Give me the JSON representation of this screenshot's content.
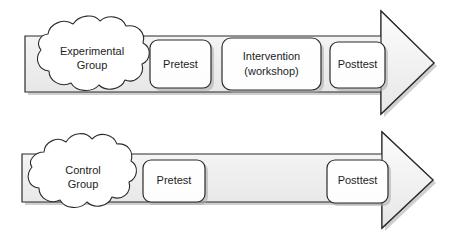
{
  "diagram": {
    "type": "process-flow",
    "background_color": "#ffffff",
    "shaft_fill_top": "#f4f4f4",
    "shaft_fill_bottom": "#e4e4e4",
    "box_fill": "#ffffff",
    "outline_color": "#2b2b2b",
    "shadow_color": "#9a9a9a",
    "rows": [
      {
        "id": "experimental",
        "group_label_line1": "Experimental",
        "group_label_line2": "Group",
        "stages": [
          {
            "id": "pretest",
            "line1": "Pretest",
            "line2": ""
          },
          {
            "id": "intervention",
            "line1": "Intervention",
            "line2": "(workshop)"
          },
          {
            "id": "posttest",
            "line1": "Posttest",
            "line2": ""
          }
        ]
      },
      {
        "id": "control",
        "group_label_line1": "Control",
        "group_label_line2": "Group",
        "stages": [
          {
            "id": "pretest",
            "line1": "Pretest",
            "line2": ""
          },
          {
            "id": "posttest",
            "line1": "Posttest",
            "line2": ""
          }
        ]
      }
    ]
  }
}
